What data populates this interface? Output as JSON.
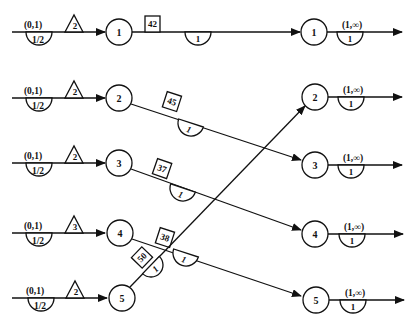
{
  "diagram": {
    "type": "flow-network",
    "input_rows": [
      {
        "node": "1",
        "arc_label": "(0,1)",
        "gain": "1/2",
        "triangle": "2"
      },
      {
        "node": "2",
        "arc_label": "(0,1)",
        "gain": "1/2",
        "triangle": "2"
      },
      {
        "node": "3",
        "arc_label": "(0,1)",
        "gain": "1/2",
        "triangle": "2"
      },
      {
        "node": "4",
        "arc_label": "(0,1)",
        "gain": "1/2",
        "triangle": "3"
      },
      {
        "node": "5",
        "arc_label": "(0,1)",
        "gain": "1/2",
        "triangle": "2"
      }
    ],
    "middle_arcs": [
      {
        "from": "1",
        "to": "1",
        "cost_box": "42",
        "gain": "1"
      },
      {
        "from": "2",
        "to": "3",
        "cost_box": "45",
        "gain": "1"
      },
      {
        "from": "3",
        "to": "4",
        "cost_box": "37",
        "gain": "1"
      },
      {
        "from": "4",
        "to": "5",
        "cost_box": "38",
        "gain": "1"
      },
      {
        "from": "5",
        "to": "2",
        "cost_box": "50",
        "gain": "1"
      }
    ],
    "output_rows": [
      {
        "node": "1",
        "arc_label": "(1,∞)",
        "gain": "1"
      },
      {
        "node": "2",
        "arc_label": "(1,∞)",
        "gain": "1"
      },
      {
        "node": "3",
        "arc_label": "(1,∞)",
        "gain": "1"
      },
      {
        "node": "4",
        "arc_label": "(1,∞)",
        "gain": "1"
      },
      {
        "node": "5",
        "arc_label": "(1,∞)",
        "gain": "1"
      }
    ]
  }
}
